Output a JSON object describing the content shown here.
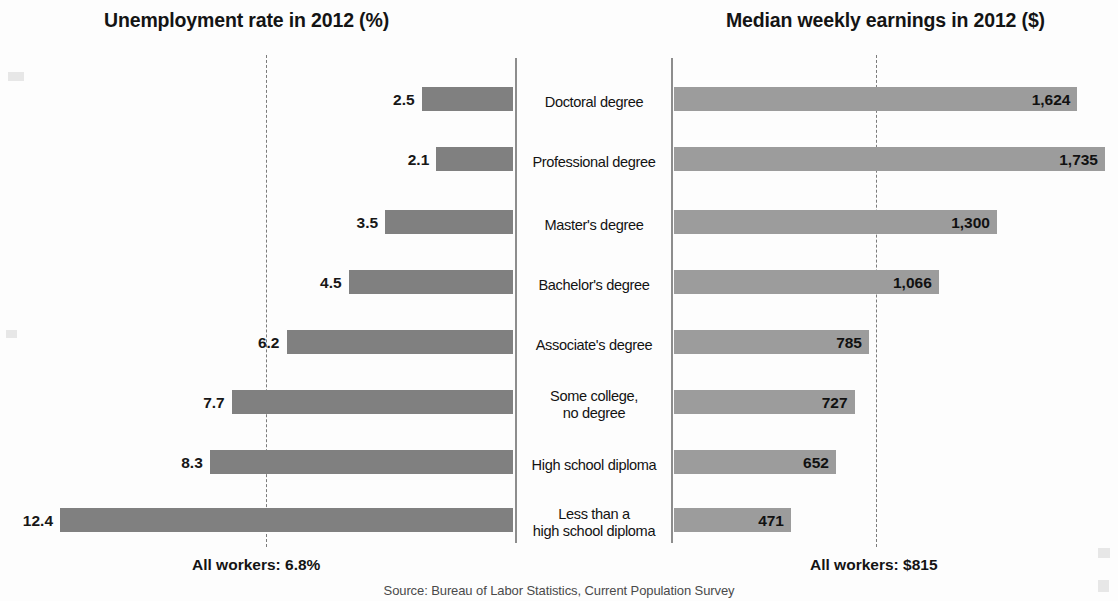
{
  "titles": {
    "left": "Unemployment rate in 2012 (%)",
    "right": "Median weekly earnings in 2012 ($)"
  },
  "footer": {
    "all_workers_left": "All workers: 6.8%",
    "all_workers_right": "All workers: $815",
    "source": "Source: Bureau of Labor Statistics, Current Population Survey"
  },
  "colors": {
    "bar_left": "#808080",
    "bar_right": "#9c9c9c",
    "axis": "#8d8d8d",
    "reference_line": "#7c7c7c",
    "text": "#141414"
  },
  "rows": [
    {
      "category": "Doctoral degree",
      "unemployment": "2.5",
      "earnings": "1,624"
    },
    {
      "category": "Professional degree",
      "unemployment": "2.1",
      "earnings": "1,735"
    },
    {
      "category": "Master's degree",
      "unemployment": "3.5",
      "earnings": "1,300"
    },
    {
      "category": "Bachelor's degree",
      "unemployment": "4.5",
      "earnings": "1,066"
    },
    {
      "category": "Associate's degree",
      "unemployment": "6.2",
      "earnings": "785"
    },
    {
      "category": "Some college,\nno degree",
      "unemployment": "7.7",
      "earnings": "727"
    },
    {
      "category": "High school diploma",
      "unemployment": "8.3",
      "earnings": "652"
    },
    {
      "category": "Less than a\nhigh school diploma",
      "unemployment": "12.4",
      "earnings": "471"
    }
  ],
  "chart_data": {
    "type": "bar",
    "orientation": "horizontal",
    "layout": "diverging-dual-panel",
    "categories": [
      "Doctoral degree",
      "Professional degree",
      "Master's degree",
      "Bachelor's degree",
      "Associate's degree",
      "Some college, no degree",
      "High school diploma",
      "Less than a high school diploma"
    ],
    "series": [
      {
        "name": "Unemployment rate in 2012 (%)",
        "side": "left",
        "unit": "%",
        "values": [
          2.5,
          2.1,
          3.5,
          4.5,
          6.2,
          7.7,
          8.3,
          12.4
        ],
        "xlim": [
          0,
          14
        ],
        "reference_line": 6.8,
        "reference_label": "All workers: 6.8%",
        "color": "#808080"
      },
      {
        "name": "Median weekly earnings in 2012 ($)",
        "side": "right",
        "unit": "$",
        "values": [
          1624,
          1735,
          1300,
          1066,
          785,
          727,
          652,
          471
        ],
        "xlim": [
          0,
          1800
        ],
        "reference_line": 815,
        "reference_label": "All workers: $815",
        "color": "#9c9c9c"
      }
    ],
    "grid": false,
    "legend": "none",
    "annotations": [
      "All workers: 6.8%",
      "All workers: $815"
    ],
    "source": "Source: Bureau of Labor Statistics, Current Population Survey"
  }
}
